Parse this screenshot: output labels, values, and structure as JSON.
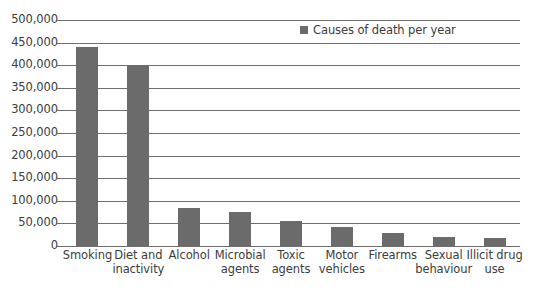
{
  "chart_data": {
    "type": "bar",
    "title": "",
    "subtitle": "",
    "xlabel": "",
    "ylabel": "",
    "ylim": [
      0,
      500000
    ],
    "grid": true,
    "legend_position": "top-right",
    "legend": [
      "Causes of death per year"
    ],
    "series_color": "#6b6b6b",
    "ytick_labels": [
      "500,000",
      "450,000",
      "400,000",
      "350,000",
      "300,000",
      "250,000",
      "200,000",
      "150,000",
      "100,000",
      "50,000",
      "0"
    ],
    "ytick_values": [
      500000,
      450000,
      400000,
      350000,
      300000,
      250000,
      200000,
      150000,
      100000,
      50000,
      0
    ],
    "categories": [
      "Smoking",
      "Diet and inactivity",
      "Alcohol",
      "Microbial agents",
      "Toxic agents",
      "Motor vehicles",
      "Firearms",
      "Sexual behaviour",
      "Illicit drug use"
    ],
    "category_lines": [
      [
        "Smoking"
      ],
      [
        "Diet and",
        "inactivity"
      ],
      [
        "Alcohol"
      ],
      [
        "Microbial",
        "agents"
      ],
      [
        "Toxic",
        "agents"
      ],
      [
        "Motor",
        "vehicles"
      ],
      [
        "Firearms"
      ],
      [
        "Sexual",
        "behaviour"
      ],
      [
        "Illicit drug",
        "use"
      ]
    ],
    "series": [
      {
        "name": "Causes of death per year",
        "values": [
          440000,
          400000,
          85000,
          75000,
          55000,
          43000,
          29000,
          20000,
          17000
        ]
      }
    ]
  }
}
